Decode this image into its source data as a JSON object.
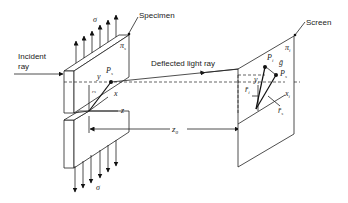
{
  "labels": {
    "specimen": "Specimen",
    "screen": "Screen",
    "incident_ray_line1": "Incident",
    "incident_ray_line2": "ray",
    "deflected_ray": "Deflected light ray",
    "sigma_top": "σ",
    "sigma_bottom": "σ",
    "pi_s": "π",
    "pi_s_sub": "s",
    "pi_i": "π",
    "pi_i_sub": "i",
    "y": "y",
    "x": "x",
    "z": "z",
    "p_s_specimen": "P",
    "p_s_specimen_sub": "s",
    "r_s_specimen": "r̄",
    "r_s_specimen_sub": "s",
    "z0": "z",
    "z0_sub": "0",
    "p_i": "P",
    "p_i_sub": "i",
    "g": "ḡ",
    "p_s_screen": "P",
    "p_s_screen_sub": "s",
    "y_i": "y",
    "y_i_sub": "i",
    "r_i": "r̄",
    "r_i_sub": "i",
    "x_i": "x",
    "x_i_sub": "i",
    "r_s_screen": "r̄",
    "r_s_screen_sub": "s"
  }
}
